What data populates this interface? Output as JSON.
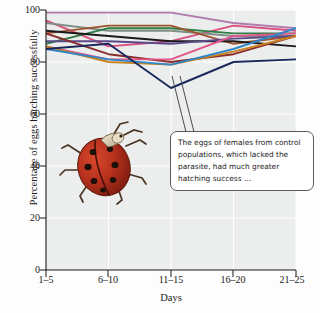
{
  "figure": {
    "background_color": "#fdfdfd",
    "plot_background_color": "#eceeed",
    "gridline_color": "#ffffff",
    "axis_color": "#1a1a1a"
  },
  "annotation": {
    "text": "The eggs of females from control populations, which lacked the parasite, had much greater hatching success …",
    "border_color": "#5a5a5a",
    "background_color": "#ffffff"
  },
  "photo": {
    "subject": "ladybug-beetle",
    "alt": "Photograph of a ladybird beetle (ladybug) with red elytra and black spots"
  },
  "chart_data": {
    "type": "line",
    "title": "",
    "xlabel": "Days",
    "ylabel": "Percentage of eggs hatching successfully",
    "categories": [
      "1–5",
      "6–10",
      "11–15",
      "16–20",
      "21–25"
    ],
    "xticklabels": [
      "1–5",
      "6–10",
      "11–15",
      "16–20",
      "21–25"
    ],
    "yticklabels": [
      "0",
      "20",
      "40",
      "60",
      "80",
      "100"
    ],
    "ytickvalues": [
      0,
      20,
      40,
      60,
      80,
      100
    ],
    "ylim": [
      0,
      100
    ],
    "grid": true,
    "legend": "none",
    "series": [
      {
        "name": "series-1",
        "color": "#b07cae",
        "values": [
          99,
          99,
          99,
          95,
          93
        ]
      },
      {
        "name": "series-2",
        "color": "#d94f7e",
        "values": [
          96,
          86,
          88,
          94,
          92
        ]
      },
      {
        "name": "series-3",
        "color": "#7f8f84",
        "values": [
          95,
          92,
          92,
          90,
          90
        ]
      },
      {
        "name": "series-4",
        "color": "#2e7d46",
        "values": [
          87,
          93,
          93,
          91,
          91
        ]
      },
      {
        "name": "series-5",
        "color": "#a0522d",
        "values": [
          91,
          94,
          94,
          87,
          90
        ]
      },
      {
        "name": "series-6",
        "color": "#1a1a1a",
        "values": [
          92,
          90,
          88,
          88,
          86
        ]
      },
      {
        "name": "series-7",
        "color": "#5b4a8a",
        "values": [
          88,
          88,
          87,
          89,
          90
        ]
      },
      {
        "name": "series-8",
        "color": "#8c2d2d",
        "values": [
          91,
          83,
          80,
          83,
          90
        ]
      },
      {
        "name": "series-9",
        "color": "#e0578a",
        "values": [
          86,
          81,
          81,
          90,
          91
        ]
      },
      {
        "name": "series-10",
        "color": "#c8831f",
        "values": [
          86,
          80,
          79,
          84,
          90
        ]
      },
      {
        "name": "series-11",
        "color": "#2f86c9",
        "values": [
          85,
          81,
          79,
          85,
          93
        ]
      },
      {
        "name": "series-12",
        "color": "#1b2a5e",
        "values": [
          85,
          87,
          70,
          80,
          81
        ]
      }
    ]
  }
}
